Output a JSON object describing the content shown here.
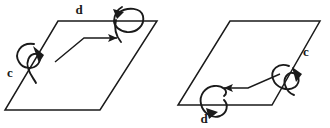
{
  "figure": {
    "type": "line-diagram",
    "background_color": "#ffffff",
    "stroke_color": "#1a1a1a",
    "label_color": "#1a1a1a",
    "panels": [
      {
        "id": "left-panel",
        "name": "left-parallelogram-diagram",
        "plane": {
          "name": "parallelogram-plane",
          "points": "58,21 157,21 100,110 5,110"
        },
        "rotation_arrows": [
          {
            "name": "rotation-arrow-c",
            "label": "c",
            "label_x": 10,
            "label_y": 77,
            "location": "left-edge",
            "direction": "arrowhead-down-right"
          },
          {
            "name": "rotation-arrow-d",
            "label": "d",
            "label_x": 79,
            "label_y": 14,
            "location": "top-edge",
            "direction": "arrowhead-up-left"
          }
        ],
        "straight_arrow": {
          "name": "bent-translation-arrow",
          "direction": "right",
          "path": "M 55,62 L 84,38 L 119,38"
        }
      },
      {
        "id": "right-panel",
        "name": "right-parallelogram-diagram",
        "plane": {
          "name": "parallelogram-plane",
          "points": "230,21 320,21 272,105 178,105"
        },
        "rotation_arrows": [
          {
            "name": "rotation-arrow-c",
            "label": "c",
            "label_x": 305,
            "label_y": 56,
            "location": "right-edge",
            "direction": "arrowhead-down-right"
          },
          {
            "name": "rotation-arrow-d",
            "label": "d",
            "label_x": 204,
            "label_y": 122,
            "location": "bottom-edge",
            "direction": "arrowhead-down-left"
          }
        ],
        "straight_arrow": {
          "name": "bent-translation-arrow",
          "direction": "left",
          "path": "M 278,75 L 248,88 L 222,88"
        }
      }
    ]
  }
}
